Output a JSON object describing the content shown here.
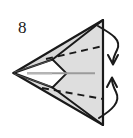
{
  "figure": {
    "type": "origami-fold-diagram",
    "step_number": "8",
    "colors": {
      "paper_fill": "#d9d9d9",
      "paper_fill_light": "#e4e4e4",
      "outline": "#1a1a1a",
      "dashed_line": "#1a1a1a",
      "center_line": "#9a9a9a",
      "white_notch": "#ffffff",
      "background": "#ffffff"
    },
    "shapes": {
      "outer_triangle_label": "outer paper triangle",
      "inner_flap_label": "inner folded flap",
      "notch_label": "white chevron opening",
      "spine_label": "right vertical spine",
      "center_line_label": "horizontal center crease"
    },
    "fold_lines": [
      {
        "name": "upper-dashed-fold",
        "style": "dashed"
      },
      {
        "name": "lower-dashed-fold",
        "style": "dashed"
      }
    ],
    "arrows": [
      {
        "name": "fold-down-arrow",
        "direction": "down",
        "position": "upper-right"
      },
      {
        "name": "fold-up-arrow",
        "direction": "up",
        "position": "lower-right"
      }
    ]
  }
}
